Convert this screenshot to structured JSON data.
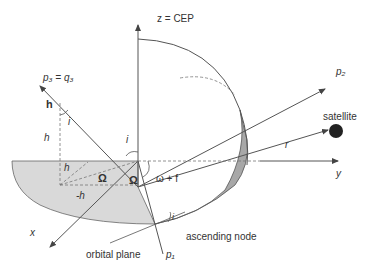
{
  "diagram": {
    "labels": {
      "z_axis": "z = CEP",
      "p3": "p₃ = q₃",
      "p2": "p₂",
      "p1": "p₁",
      "h_vec": "h",
      "hz": "hₓ",
      "hz_label": "h",
      "hz_sub": "z",
      "hx_label": "h",
      "hx_sub": "x",
      "hy_label": "-h",
      "hy_sub": "y",
      "incl_top": "i",
      "incl_center": "i",
      "incl_node": "i",
      "omega_left": "Ω",
      "omega_center": "Ω",
      "arg_lat": "ω + f",
      "satellite": "satellite",
      "r": "r",
      "x_axis": "x",
      "y_axis": "y",
      "orbital_plane": "orbital plane",
      "ascending_node": "ascending node"
    },
    "colors": {
      "line": "#555555",
      "equatorial_fill": "#d9d9d9",
      "orbit_fill": "#a8a8a8",
      "satellite": "#222222"
    }
  }
}
